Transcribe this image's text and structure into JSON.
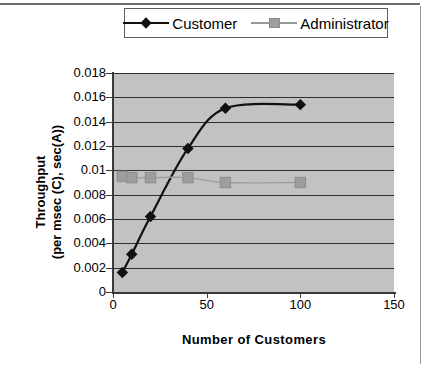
{
  "legend": {
    "position": "top-center",
    "entries": [
      {
        "label": "Customer",
        "marker": "diamond",
        "color": "#111111"
      },
      {
        "label": "Administrator",
        "marker": "square",
        "color": "#9d9d9d"
      }
    ]
  },
  "axes": {
    "y_title_line1": "Throughput",
    "y_title_line2": "(per msec (C), sec(A))",
    "x_title": "Number of Customers",
    "y_ticks": [
      "0.018",
      "0.016",
      "0.014",
      "0.012",
      "0.01",
      "0.008",
      "0.006",
      "0.004",
      "0.002",
      "0"
    ],
    "x_ticks": [
      "0",
      "50",
      "100",
      "150"
    ]
  },
  "colors": {
    "plot_background": "#c2c2c2",
    "gridline": "#2e2e2e",
    "axis": "#3a3a3a",
    "customer": "#111111",
    "administrator": "#9d9d9d",
    "page_background": "#ffffff"
  },
  "chart_data": {
    "type": "line",
    "title": "",
    "xlabel": "Number of Customers",
    "ylabel": "Throughput (per msec (C), sec(A))",
    "xlim": [
      0,
      150
    ],
    "ylim": [
      0,
      0.018
    ],
    "xticks": [
      0,
      50,
      100,
      150
    ],
    "yticks": [
      0,
      0.002,
      0.004,
      0.006,
      0.008,
      0.01,
      0.012,
      0.014,
      0.016,
      0.018
    ],
    "grid": "horizontal",
    "legend_position": "top-center",
    "x": [
      5,
      10,
      20,
      40,
      60,
      100
    ],
    "series": [
      {
        "name": "Customer",
        "marker": "diamond",
        "color": "#111111",
        "values": [
          0.0016,
          0.0031,
          0.0062,
          0.0118,
          0.0151,
          0.0154
        ]
      },
      {
        "name": "Administrator",
        "marker": "square",
        "color": "#9d9d9d",
        "values": [
          0.0095,
          0.0094,
          0.0094,
          0.0094,
          0.009,
          0.009
        ]
      }
    ]
  }
}
